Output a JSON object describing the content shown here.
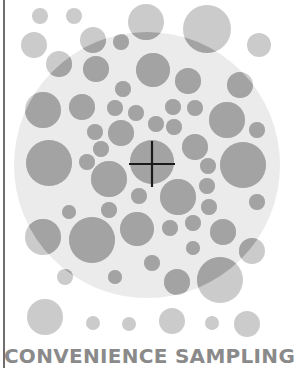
{
  "caption": "CONVENIENCE SAMPLING",
  "colors": {
    "population_area": "#ebebeb",
    "outside_circle": "#cbcbcb",
    "inside_circle": "#a3a3a3",
    "crosshair": "#1a1a1a",
    "caption": "#8a8a8a",
    "frame_line": "#6e6e6e"
  },
  "population": {
    "cx": 147,
    "cy": 165,
    "r": 133
  },
  "crosshair": {
    "cx": 152,
    "cy": 164,
    "half_length": 23
  },
  "circles": [
    {
      "cx": 40,
      "cy": 16,
      "r": 8,
      "zone": "outside"
    },
    {
      "cx": 74,
      "cy": 16,
      "r": 8,
      "zone": "outside"
    },
    {
      "cx": 34,
      "cy": 45,
      "r": 13,
      "zone": "outside"
    },
    {
      "cx": 59,
      "cy": 64,
      "r": 13,
      "zone": "edge"
    },
    {
      "cx": 93,
      "cy": 40,
      "r": 13,
      "zone": "edge"
    },
    {
      "cx": 146,
      "cy": 22,
      "r": 18,
      "zone": "edge"
    },
    {
      "cx": 207,
      "cy": 29,
      "r": 24,
      "zone": "edge"
    },
    {
      "cx": 259,
      "cy": 45,
      "r": 12,
      "zone": "outside"
    },
    {
      "cx": 121,
      "cy": 42,
      "r": 8,
      "zone": "inside"
    },
    {
      "cx": 96,
      "cy": 69,
      "r": 13,
      "zone": "inside"
    },
    {
      "cx": 153,
      "cy": 70,
      "r": 17,
      "zone": "inside"
    },
    {
      "cx": 123,
      "cy": 89,
      "r": 8,
      "zone": "inside"
    },
    {
      "cx": 188,
      "cy": 81,
      "r": 13,
      "zone": "inside"
    },
    {
      "cx": 240,
      "cy": 85,
      "r": 13,
      "zone": "inside"
    },
    {
      "cx": 43,
      "cy": 110,
      "r": 18,
      "zone": "inside"
    },
    {
      "cx": 82,
      "cy": 107,
      "r": 13,
      "zone": "inside"
    },
    {
      "cx": 115,
      "cy": 108,
      "r": 8,
      "zone": "inside"
    },
    {
      "cx": 136,
      "cy": 113,
      "r": 8,
      "zone": "inside"
    },
    {
      "cx": 173,
      "cy": 107,
      "r": 8,
      "zone": "inside"
    },
    {
      "cx": 195,
      "cy": 108,
      "r": 8,
      "zone": "inside"
    },
    {
      "cx": 227,
      "cy": 120,
      "r": 18,
      "zone": "inside"
    },
    {
      "cx": 257,
      "cy": 130,
      "r": 8,
      "zone": "inside"
    },
    {
      "cx": 95,
      "cy": 132,
      "r": 8,
      "zone": "inside"
    },
    {
      "cx": 121,
      "cy": 133,
      "r": 13,
      "zone": "inside"
    },
    {
      "cx": 156,
      "cy": 124,
      "r": 8,
      "zone": "inside"
    },
    {
      "cx": 174,
      "cy": 127,
      "r": 8,
      "zone": "inside"
    },
    {
      "cx": 101,
      "cy": 149,
      "r": 8,
      "zone": "inside"
    },
    {
      "cx": 195,
      "cy": 147,
      "r": 13,
      "zone": "inside"
    },
    {
      "cx": 49,
      "cy": 163,
      "r": 23,
      "zone": "inside"
    },
    {
      "cx": 87,
      "cy": 162,
      "r": 8,
      "zone": "inside"
    },
    {
      "cx": 152,
      "cy": 162,
      "r": 22,
      "zone": "target"
    },
    {
      "cx": 208,
      "cy": 166,
      "r": 8,
      "zone": "inside"
    },
    {
      "cx": 243,
      "cy": 165,
      "r": 23,
      "zone": "inside"
    },
    {
      "cx": 109,
      "cy": 179,
      "r": 18,
      "zone": "inside"
    },
    {
      "cx": 207,
      "cy": 186,
      "r": 8,
      "zone": "inside"
    },
    {
      "cx": 139,
      "cy": 196,
      "r": 8,
      "zone": "inside"
    },
    {
      "cx": 178,
      "cy": 197,
      "r": 18,
      "zone": "inside"
    },
    {
      "cx": 257,
      "cy": 202,
      "r": 8,
      "zone": "inside"
    },
    {
      "cx": 69,
      "cy": 212,
      "r": 7,
      "zone": "inside"
    },
    {
      "cx": 109,
      "cy": 210,
      "r": 8,
      "zone": "inside"
    },
    {
      "cx": 209,
      "cy": 207,
      "r": 8,
      "zone": "inside"
    },
    {
      "cx": 137,
      "cy": 229,
      "r": 17,
      "zone": "inside"
    },
    {
      "cx": 170,
      "cy": 228,
      "r": 8,
      "zone": "inside"
    },
    {
      "cx": 193,
      "cy": 223,
      "r": 8,
      "zone": "inside"
    },
    {
      "cx": 223,
      "cy": 232,
      "r": 13,
      "zone": "inside"
    },
    {
      "cx": 43,
      "cy": 237,
      "r": 18,
      "zone": "edge"
    },
    {
      "cx": 92,
      "cy": 240,
      "r": 23,
      "zone": "inside"
    },
    {
      "cx": 193,
      "cy": 248,
      "r": 7,
      "zone": "inside"
    },
    {
      "cx": 252,
      "cy": 251,
      "r": 13,
      "zone": "edge"
    },
    {
      "cx": 152,
      "cy": 263,
      "r": 8,
      "zone": "inside"
    },
    {
      "cx": 65,
      "cy": 277,
      "r": 8,
      "zone": "edge"
    },
    {
      "cx": 115,
      "cy": 277,
      "r": 7,
      "zone": "inside"
    },
    {
      "cx": 177,
      "cy": 282,
      "r": 13,
      "zone": "inside"
    },
    {
      "cx": 220,
      "cy": 280,
      "r": 23,
      "zone": "edge"
    },
    {
      "cx": 45,
      "cy": 317,
      "r": 18,
      "zone": "outside"
    },
    {
      "cx": 93,
      "cy": 323,
      "r": 7,
      "zone": "outside"
    },
    {
      "cx": 129,
      "cy": 324,
      "r": 7,
      "zone": "outside"
    },
    {
      "cx": 172,
      "cy": 321,
      "r": 13,
      "zone": "outside"
    },
    {
      "cx": 212,
      "cy": 323,
      "r": 7,
      "zone": "outside"
    },
    {
      "cx": 247,
      "cy": 324,
      "r": 13,
      "zone": "outside"
    }
  ]
}
